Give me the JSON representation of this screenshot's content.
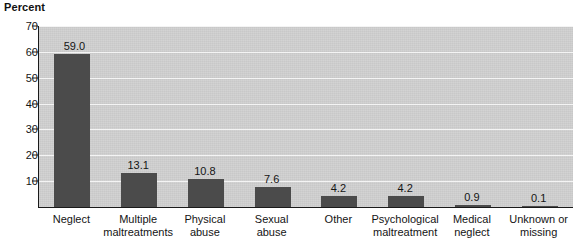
{
  "chart_data": {
    "type": "bar",
    "title": "",
    "ylabel": "Percent",
    "xlabel": "",
    "ylim": [
      0,
      70
    ],
    "yticks": [
      0,
      10,
      20,
      30,
      40,
      50,
      60,
      70
    ],
    "ytick_labels": [
      "",
      "10",
      "20",
      "30",
      "40",
      "50",
      "60",
      "70"
    ],
    "grid": "horizontal",
    "legend": "none",
    "categories": [
      "Neglect",
      "Multiple\nmaltreatments",
      "Physical\nabuse",
      "Sexual\nabuse",
      "Other",
      "Psychological\nmaltreatment",
      "Medical\nneglect",
      "Unknown or\nmissing"
    ],
    "values": [
      59.0,
      13.1,
      10.8,
      7.6,
      4.2,
      4.2,
      0.9,
      0.1
    ],
    "value_labels": [
      "59.0",
      "13.1",
      "10.8",
      "7.6",
      "4.2",
      "4.2",
      "0.9",
      "0.1"
    ],
    "colors": {
      "bar": "#4b4b4b",
      "plot_background": "#cfcfcf",
      "gridline": "#f4f4f4",
      "axis": "#1a1a1a",
      "text": "#141414",
      "page_background": "#ffffff"
    }
  }
}
